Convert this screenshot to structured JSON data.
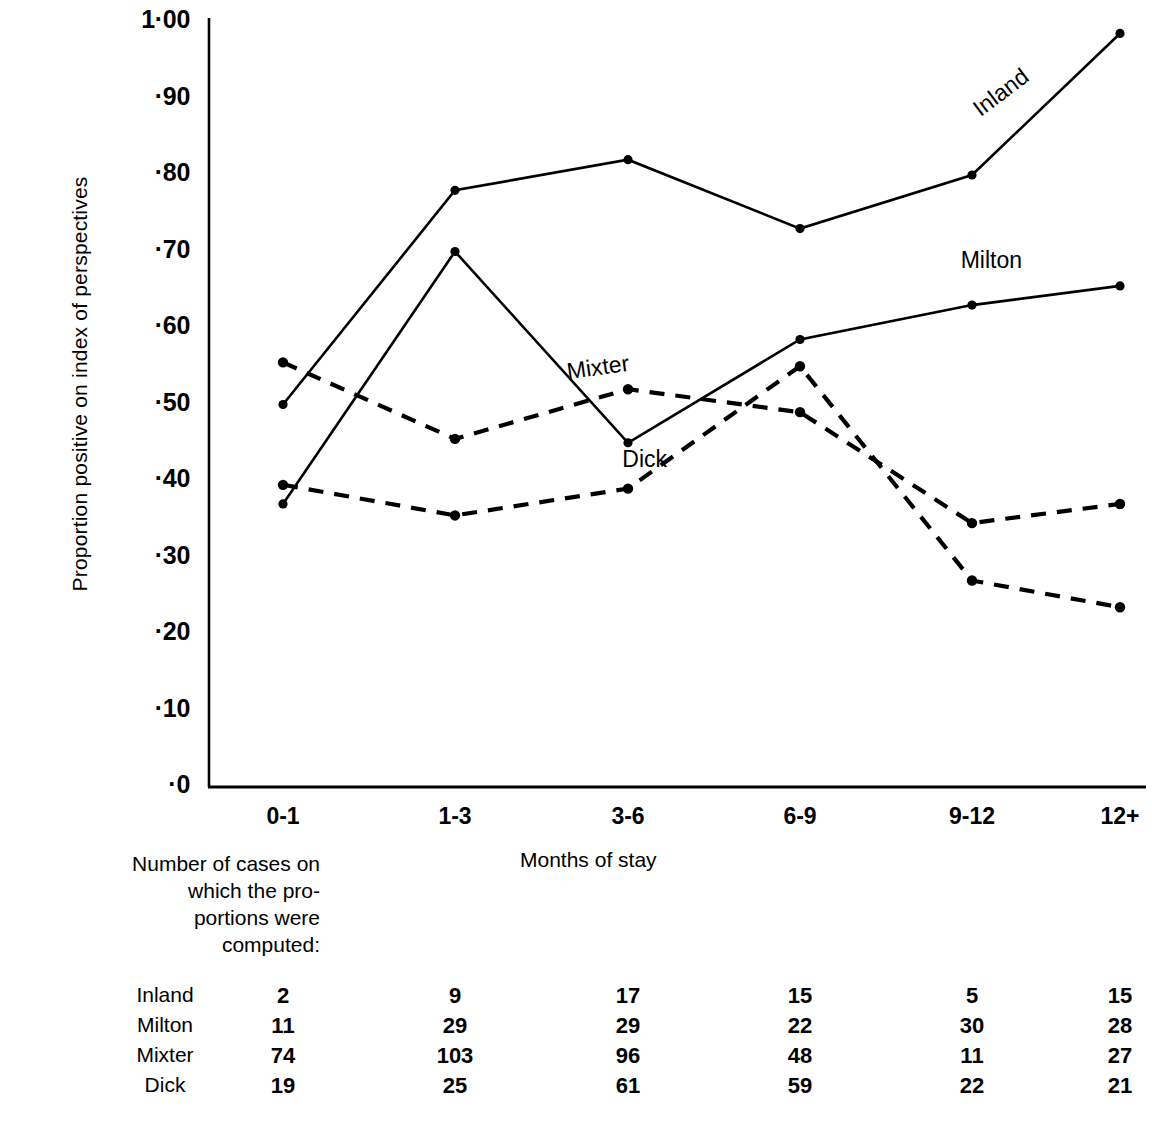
{
  "chart_data": {
    "type": "line",
    "title": "",
    "xlabel": "Months of stay",
    "ylabel": "Proportion positive on index of perspectives",
    "categories": [
      "0-1",
      "1-3",
      "3-6",
      "6-9",
      "9-12",
      "12+"
    ],
    "ylim": [
      0,
      1.0
    ],
    "ytick_labels": [
      "1·00",
      "·90",
      "·80",
      "·70",
      "·60",
      "·50",
      "·40",
      "·30",
      "·20",
      "·10",
      "·0"
    ],
    "ytick_values": [
      1.0,
      0.9,
      0.8,
      0.7,
      0.6,
      0.5,
      0.4,
      0.3,
      0.2,
      0.1,
      0.0
    ],
    "grid": false,
    "legend_position": "inline-labels",
    "series": [
      {
        "name": "Inland",
        "style": "solid",
        "values": [
          0.5,
          0.78,
          0.82,
          0.73,
          0.8,
          0.985
        ]
      },
      {
        "name": "Milton",
        "style": "solid",
        "values": [
          0.37,
          0.7,
          0.45,
          0.585,
          0.63,
          0.655
        ]
      },
      {
        "name": "Mixter",
        "style": "dashed",
        "values": [
          0.555,
          0.455,
          0.52,
          0.49,
          0.345,
          0.37
        ]
      },
      {
        "name": "Dick",
        "style": "dashed",
        "values": [
          0.395,
          0.355,
          0.39,
          0.55,
          0.27,
          0.235
        ]
      }
    ],
    "annotations": [
      {
        "text": "Inland",
        "x": 0.845,
        "y": 0.905,
        "rotation": -37
      },
      {
        "text": "Milton",
        "x": 0.835,
        "y": 0.685,
        "rotation": 0
      },
      {
        "text": "Mixter",
        "x": 0.415,
        "y": 0.545,
        "rotation": -8
      },
      {
        "text": "Dick",
        "x": 0.465,
        "y": 0.425,
        "rotation": 0
      }
    ]
  },
  "caption": {
    "lines": [
      "Number of cases on",
      "which the pro-",
      "portions were",
      "computed:"
    ]
  },
  "table": {
    "rows": [
      {
        "label": "Inland",
        "values": [
          "2",
          "9",
          "17",
          "15",
          "5",
          "15"
        ]
      },
      {
        "label": "Milton",
        "values": [
          "11",
          "29",
          "29",
          "22",
          "30",
          "28"
        ]
      },
      {
        "label": "Mixter",
        "values": [
          "74",
          "103",
          "96",
          "48",
          "11",
          "27"
        ]
      },
      {
        "label": "Dick",
        "values": [
          "19",
          "25",
          "61",
          "59",
          "22",
          "21"
        ]
      }
    ]
  },
  "colors": {
    "ink": "#000000",
    "background": "#ffffff"
  }
}
